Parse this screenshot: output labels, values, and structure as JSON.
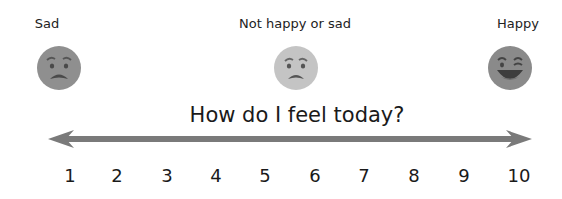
{
  "labels": {
    "left": "Sad",
    "middle": "Not happy or sad",
    "right": "Happy"
  },
  "faces": [
    {
      "name": "sad-face-icon",
      "color": "#8f8f8f"
    },
    {
      "name": "neutral-face-icon",
      "color": "#c4c4c4"
    },
    {
      "name": "happy-face-icon",
      "color": "#8a8a8a"
    }
  ],
  "title": "How do I feel today?",
  "scale": {
    "arrow_color": "#7a7a7a",
    "numbers": [
      "1",
      "2",
      "3",
      "4",
      "5",
      "6",
      "7",
      "8",
      "9",
      "10"
    ]
  }
}
